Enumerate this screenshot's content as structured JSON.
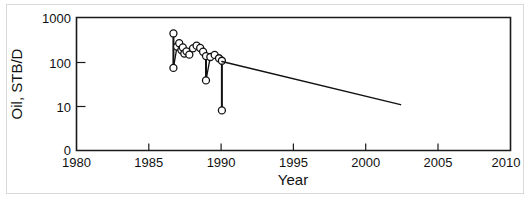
{
  "figure": {
    "background_color": "#ffffff",
    "frame_color": "#d9d9d9",
    "ink_color": "#111111"
  },
  "chart_data": {
    "type": "line",
    "title": "",
    "subtitle": "",
    "xlabel": "Year",
    "ylabel": "Oil, STB/D",
    "xlim": [
      1980,
      2010
    ],
    "ylim": [
      0,
      1000
    ],
    "yscale": "log-with-zero-baseline",
    "grid": false,
    "legend": null,
    "legend_position": "none",
    "xticks": [
      1980,
      1985,
      1990,
      1995,
      2000,
      2005,
      2010
    ],
    "xtick_labels": [
      "1980",
      "1985",
      "1990",
      "1995",
      "2000",
      "2005",
      "2010"
    ],
    "yticks": [
      0,
      10,
      100,
      1000
    ],
    "ytick_labels": [
      "0",
      "10",
      "100",
      "1000"
    ],
    "annotations": [],
    "series": [
      {
        "name": "Measured oil rate",
        "marker": "open-circle",
        "connected": true,
        "points": [
          {
            "x": 1986.7,
            "y": 420
          },
          {
            "x": 1986.7,
            "y": 72
          },
          {
            "x": 1986.95,
            "y": 215
          },
          {
            "x": 1987.1,
            "y": 255
          },
          {
            "x": 1987.25,
            "y": 180
          },
          {
            "x": 1987.35,
            "y": 205
          },
          {
            "x": 1987.45,
            "y": 150
          },
          {
            "x": 1987.6,
            "y": 168
          },
          {
            "x": 1987.8,
            "y": 142
          },
          {
            "x": 1988.05,
            "y": 196
          },
          {
            "x": 1988.3,
            "y": 225
          },
          {
            "x": 1988.55,
            "y": 200
          },
          {
            "x": 1988.75,
            "y": 165
          },
          {
            "x": 1988.95,
            "y": 132
          },
          {
            "x": 1988.95,
            "y": 38
          },
          {
            "x": 1989.25,
            "y": 126
          },
          {
            "x": 1989.55,
            "y": 140
          },
          {
            "x": 1989.85,
            "y": 118
          },
          {
            "x": 1990.05,
            "y": 104
          },
          {
            "x": 1990.05,
            "y": 8.2
          }
        ]
      },
      {
        "name": "Decline trend forecast",
        "marker": "none",
        "connected": true,
        "points": [
          {
            "x": 1990.05,
            "y": 100
          },
          {
            "x": 2002.4,
            "y": 11
          }
        ]
      }
    ]
  }
}
